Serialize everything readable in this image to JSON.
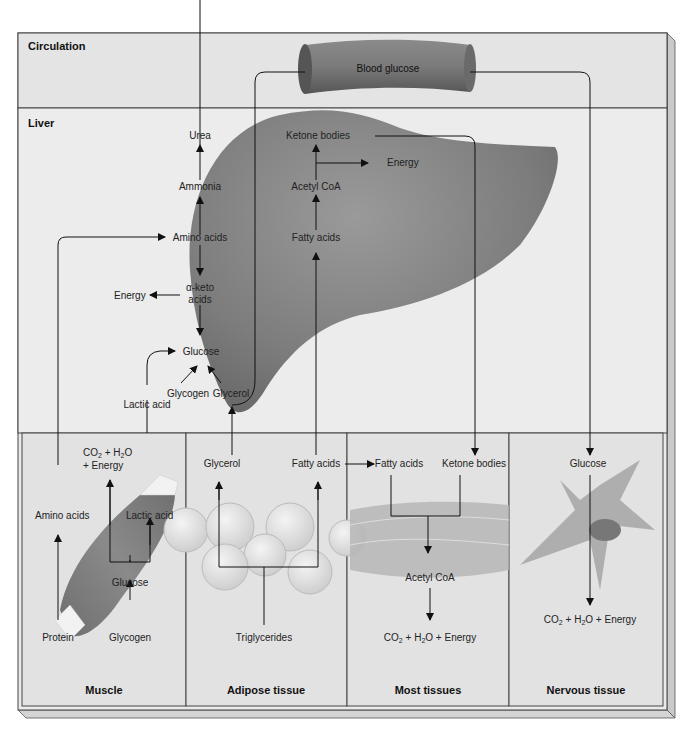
{
  "regions": {
    "circulation": "Circulation",
    "liver": "Liver",
    "muscle": "Muscle",
    "adipose": "Adipose tissue",
    "most_tissues": "Most tissues",
    "nervous": "Nervous tissue"
  },
  "circulation": {
    "vessel_label": "Blood glucose"
  },
  "liver": {
    "urea": "Urea",
    "ammonia": "Ammonia",
    "amino_acids": "Amino acids",
    "alpha_keto_line1": "α-keto",
    "alpha_keto_line2": "acids",
    "energy_left": "Energy",
    "glucose": "Glucose",
    "glycogen": "Glycogen",
    "glycerol": "Glycerol",
    "lactic_acid": "Lactic acid",
    "ketone_bodies": "Ketone bodies",
    "energy_right": "Energy",
    "acetyl_coa": "Acetyl CoA",
    "fatty_acids": "Fatty acids"
  },
  "muscle": {
    "co2_line1_a": "CO",
    "co2_line1_sub": "2",
    "co2_line1_b": " + H",
    "co2_line1_sub2": "2",
    "co2_line1_c": "O",
    "co2_line2": "+ Energy",
    "amino_acids": "Amino acids",
    "lactic_acid": "Lactic acid",
    "glucose": "Glucose",
    "protein": "Protein",
    "glycogen": "Glycogen"
  },
  "adipose": {
    "glycerol": "Glycerol",
    "fatty_acids": "Fatty acids",
    "triglycerides": "Triglycerides"
  },
  "most_tissues": {
    "fatty_acids": "Fatty acids",
    "ketone_bodies": "Ketone bodies",
    "acetyl_coa": "Acetyl CoA",
    "out_a": "CO",
    "out_sub1": "2",
    "out_b": " + H",
    "out_sub2": "2",
    "out_c": "O + Energy"
  },
  "nervous": {
    "glucose": "Glucose",
    "out_a": "CO",
    "out_sub1": "2",
    "out_b": " + H",
    "out_sub2": "2",
    "out_c": "O + Energy"
  }
}
